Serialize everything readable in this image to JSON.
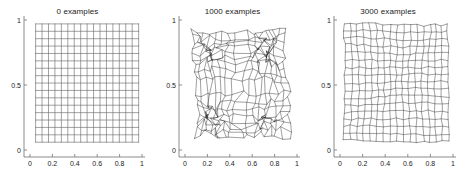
{
  "figure": {
    "background_color": "#ffffff",
    "axis_color": "#808080",
    "mesh_color": "#1a1a1a",
    "grid_color": "#555555",
    "text_color": "#1a1a1a",
    "width": 466,
    "height": 173
  },
  "chart_data": {
    "type": "line",
    "title": "",
    "subplots": [
      {
        "title": "0 examples",
        "xlabel": "",
        "ylabel": "",
        "xlim": [
          0,
          1
        ],
        "ylim": [
          0,
          1
        ],
        "xticks": [
          0,
          0.2,
          0.4,
          0.6,
          0.8,
          1
        ],
        "xtick_labels": [
          "0",
          "0.2",
          "0.4",
          "0.6",
          "0.8",
          "1"
        ],
        "yticks": [
          0,
          0.5,
          1
        ],
        "ytick_labels": [
          "0",
          "0.5",
          "1"
        ],
        "grid": false,
        "legend": "none",
        "mesh": {
          "rows": 17,
          "cols": 17,
          "x_extent": [
            0.05,
            0.97
          ],
          "y_extent": [
            0.06,
            0.97
          ],
          "distortion": 0.0,
          "cluster_strength": 0.0,
          "seed": 11,
          "description": "regular undistorted lattice of node positions"
        }
      },
      {
        "title": "1000 examples",
        "xlabel": "",
        "ylabel": "",
        "xlim": [
          0,
          1
        ],
        "ylim": [
          0,
          1
        ],
        "xticks": [
          0,
          0.2,
          0.4,
          0.6,
          0.8,
          1
        ],
        "xtick_labels": [
          "0",
          "0.2",
          "0.4",
          "0.6",
          "0.8",
          "1"
        ],
        "yticks": [
          0,
          0.5,
          1
        ],
        "ytick_labels": [
          "0",
          "0.5",
          "1"
        ],
        "grid": false,
        "legend": "none",
        "mesh": {
          "rows": 17,
          "cols": 17,
          "x_extent": [
            0.07,
            0.93
          ],
          "y_extent": [
            0.08,
            0.95
          ],
          "distortion": 0.62,
          "cluster_strength": 0.85,
          "seed": 7,
          "clusters": [
            [
              0.22,
              0.74
            ],
            [
              0.75,
              0.76
            ],
            [
              0.22,
              0.25
            ],
            [
              0.72,
              0.23
            ]
          ],
          "description": "strongly tangled lattice with four dense node clusters"
        }
      },
      {
        "title": "3000 examples",
        "xlabel": "",
        "ylabel": "",
        "xlim": [
          0,
          1
        ],
        "ylim": [
          0,
          1
        ],
        "xticks": [
          0,
          0.2,
          0.4,
          0.6,
          0.8,
          1
        ],
        "xtick_labels": [
          "0",
          "0.2",
          "0.4",
          "0.6",
          "0.8",
          "1"
        ],
        "yticks": [
          0,
          0.5,
          1
        ],
        "ytick_labels": [
          "0",
          "0.5",
          "1"
        ],
        "grid": false,
        "legend": "none",
        "mesh": {
          "rows": 17,
          "cols": 17,
          "x_extent": [
            0.04,
            0.96
          ],
          "y_extent": [
            0.07,
            0.97
          ],
          "distortion": 0.22,
          "cluster_strength": 0.12,
          "seed": 23,
          "clusters": [
            [
              0.83,
              0.9
            ]
          ],
          "description": "relaxed near-uniform lattice with mild local warping"
        }
      }
    ]
  }
}
